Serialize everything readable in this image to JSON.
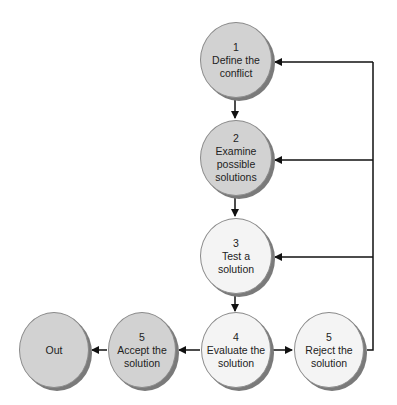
{
  "diagram": {
    "type": "flowchart",
    "colors": {
      "gray_fill": "#d2d2d2",
      "white_fill": "#f4f4f4",
      "shadow": "#7a7a7a",
      "line": "#111111"
    },
    "nodes": [
      {
        "id": "define",
        "number": "1",
        "label_line1": "Define the",
        "label_line2": "conflict",
        "label_line3": ""
      },
      {
        "id": "examine",
        "number": "2",
        "label_line1": "Examine",
        "label_line2": "possible",
        "label_line3": "solutions"
      },
      {
        "id": "test",
        "number": "3",
        "label_line1": "Test a",
        "label_line2": "solution",
        "label_line3": ""
      },
      {
        "id": "evaluate",
        "number": "4",
        "label_line1": "Evaluate the",
        "label_line2": "solution",
        "label_line3": ""
      },
      {
        "id": "reject",
        "number": "5",
        "label_line1": "Reject the",
        "label_line2": "solution",
        "label_line3": ""
      },
      {
        "id": "accept",
        "number": "5",
        "label_line1": "Accept the",
        "label_line2": "solution",
        "label_line3": ""
      },
      {
        "id": "out",
        "number": "",
        "label_line1": "Out",
        "label_line2": "",
        "label_line3": ""
      }
    ],
    "edges": [
      {
        "from": "define",
        "to": "examine"
      },
      {
        "from": "examine",
        "to": "test"
      },
      {
        "from": "test",
        "to": "evaluate"
      },
      {
        "from": "evaluate",
        "to": "reject"
      },
      {
        "from": "evaluate",
        "to": "accept"
      },
      {
        "from": "accept",
        "to": "out"
      },
      {
        "from": "reject",
        "to": "define"
      },
      {
        "from": "reject",
        "to": "examine"
      },
      {
        "from": "reject",
        "to": "test"
      }
    ]
  }
}
